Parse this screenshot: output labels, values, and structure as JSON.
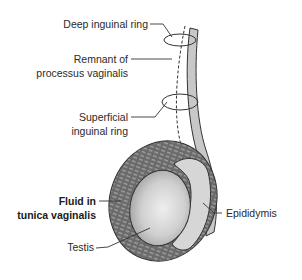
{
  "figure": {
    "labels": {
      "deep_ring": "Deep inguinal ring",
      "remnant_line1": "Remnant of",
      "remnant_line2": "processus vaginalis",
      "superficial_line1": "Superficial",
      "superficial_line2": "inguinal ring",
      "fluid_line1": "Fluid in",
      "fluid_line2": "tunica vaginalis",
      "testis": "Testis",
      "epididymis": "Epididymis"
    },
    "colors": {
      "background": "#ffffff",
      "outline": "#333333",
      "fluid_fill": "#6e6e6e",
      "fluid_hatch": "#9a9a9a",
      "testis_light": "#e6e6e6",
      "testis_dark": "#a8a8a8",
      "epididymis_fill": "#d4d4d4",
      "cord_fill": "#c8c8c8",
      "label_text": "#2a2a2a"
    }
  }
}
